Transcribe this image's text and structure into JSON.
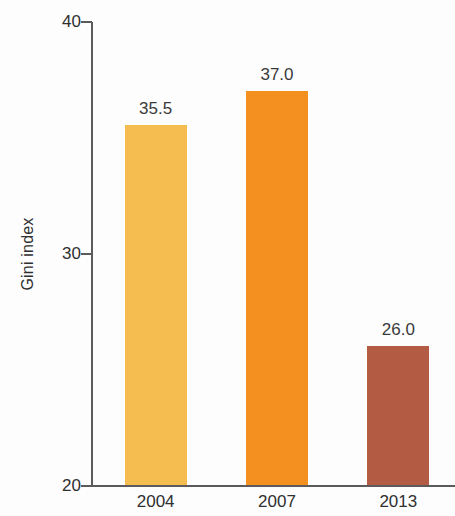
{
  "chart_data": {
    "type": "bar",
    "title": "",
    "subtitle": "",
    "xlabel": "",
    "ylabel": "Gini index",
    "categories": [
      "2004",
      "2007",
      "2013"
    ],
    "values": [
      35.5,
      37.0,
      26.0
    ],
    "value_labels": [
      "35.5",
      "37.0",
      "26.0"
    ],
    "bar_colors": [
      "#f5bc50",
      "#f3901f",
      "#b35b43"
    ],
    "ylim": [
      20,
      40
    ],
    "y_ticks": [
      20,
      30,
      40
    ],
    "y_tick_labels": [
      "20",
      "30",
      "40"
    ],
    "grid": false,
    "legend": null,
    "annotations": []
  },
  "axis": {
    "line_color": "#5b5b5b",
    "text_color": "#2f2f2f"
  },
  "background_color": "#fdfdfd"
}
